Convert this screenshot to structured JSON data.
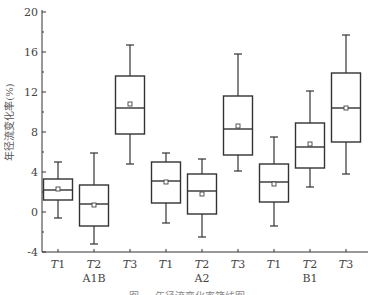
{
  "chart_data": {
    "type": "box",
    "title": "",
    "xlabel": "",
    "ylabel": "年径流变化率(%)",
    "ylim": [
      -4,
      20
    ],
    "yticks": [
      -4,
      0,
      4,
      8,
      12,
      16,
      20
    ],
    "grid": false,
    "legend": null,
    "groups": [
      "A1B",
      "A2",
      "B1"
    ],
    "periods": [
      "T1",
      "T2",
      "T3"
    ],
    "categories": [
      "T1",
      "T2",
      "T3",
      "T1",
      "T2",
      "T3",
      "T1",
      "T2",
      "T3"
    ],
    "series": [
      {
        "group": "A1B",
        "period": "T1",
        "whisker_low": -0.6,
        "q1": 1.2,
        "median": 2.2,
        "q3": 3.3,
        "whisker_high": 5.0,
        "mean": 2.3
      },
      {
        "group": "A1B",
        "period": "T2",
        "whisker_low": -3.2,
        "q1": -1.4,
        "median": 0.8,
        "q3": 2.7,
        "whisker_high": 5.9,
        "mean": 0.7
      },
      {
        "group": "A1B",
        "period": "T3",
        "whisker_low": 4.8,
        "q1": 7.8,
        "median": 10.4,
        "q3": 13.6,
        "whisker_high": 16.7,
        "mean": 10.8
      },
      {
        "group": "A2",
        "period": "T1",
        "whisker_low": -1.1,
        "q1": 0.9,
        "median": 3.1,
        "q3": 5.0,
        "whisker_high": 5.9,
        "mean": 3.0
      },
      {
        "group": "A2",
        "period": "T2",
        "whisker_low": -2.5,
        "q1": -0.2,
        "median": 2.1,
        "q3": 3.8,
        "whisker_high": 5.3,
        "mean": 1.8
      },
      {
        "group": "A2",
        "period": "T3",
        "whisker_low": 4.1,
        "q1": 5.7,
        "median": 8.3,
        "q3": 11.6,
        "whisker_high": 15.8,
        "mean": 8.6
      },
      {
        "group": "B1",
        "period": "T1",
        "whisker_low": -1.4,
        "q1": 1.0,
        "median": 3.0,
        "q3": 4.8,
        "whisker_high": 7.5,
        "mean": 2.8
      },
      {
        "group": "B1",
        "period": "T2",
        "whisker_low": 2.5,
        "q1": 4.4,
        "median": 6.5,
        "q3": 8.9,
        "whisker_high": 12.1,
        "mean": 6.8
      },
      {
        "group": "B1",
        "period": "T3",
        "whisker_low": 3.8,
        "q1": 7.0,
        "median": 10.4,
        "q3": 13.9,
        "whisker_high": 17.7,
        "mean": 10.4
      }
    ]
  },
  "ylabel_text": "年径流变化率(%)",
  "caption_text": "图 … 年径流变化率箱线图"
}
